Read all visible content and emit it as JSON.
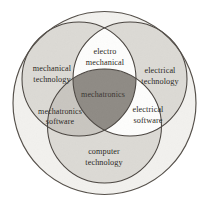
{
  "figure": {
    "background_color": "#ffffff",
    "stroke_color": "#4a4540",
    "text_color": "#2b2824"
  },
  "outer_circle": {
    "name": "enclosing-circle",
    "cx": 104.5,
    "cy": 103,
    "r": 91.5,
    "fill": "#f2f1ee"
  },
  "sets": [
    {
      "id": "mechanical",
      "label": "mechanical\ntechnology",
      "label_line1": "mechanical",
      "label_line2": "technology",
      "cx": 79,
      "cy": 79,
      "r": 57,
      "fill": "#dcdad5",
      "label_x": 52,
      "label_y": 74
    },
    {
      "id": "electrical",
      "label": "electrical\ntechnology",
      "label_line1": "electrical",
      "label_line2": "technology",
      "cx": 130,
      "cy": 79,
      "r": 57,
      "fill": "#dcdad5",
      "label_x": 160,
      "label_y": 76
    },
    {
      "id": "computer",
      "label": "computer\ntechnology",
      "label_line1": "computer",
      "label_line2": "technology",
      "cx": 104.5,
      "cy": 126,
      "r": 57,
      "fill": "#dcdad5",
      "label_x": 104,
      "label_y": 157
    }
  ],
  "intersections": [
    {
      "id": "electro-mechanical",
      "label_line1": "electro",
      "label_line2": "mechanical",
      "between": [
        "mechanical",
        "electrical"
      ],
      "fill": "#fdfdfc",
      "label_x": 105,
      "label_y": 57
    },
    {
      "id": "mechatronics-software",
      "label_line1": "mechatronics",
      "label_line2": "software",
      "between": [
        "mechanical",
        "computer"
      ],
      "fill": "#c9c6c0",
      "label_x": 60,
      "label_y": 116
    },
    {
      "id": "electrical-software",
      "label_line1": "electrical",
      "label_line2": "software",
      "between": [
        "electrical",
        "computer"
      ],
      "fill": "#fdfdfc",
      "label_x": 148,
      "label_y": 115
    }
  ],
  "center": {
    "id": "mechatronics",
    "label": "mechatronics",
    "between": [
      "mechanical",
      "electrical",
      "computer"
    ],
    "fill": "#8f8b85",
    "label_x": 103,
    "label_y": 95
  }
}
